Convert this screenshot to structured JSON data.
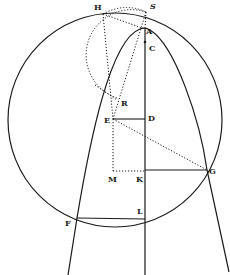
{
  "figure": {
    "type": "geometric-construction",
    "stroke_color": "#1a1a1a",
    "background": "#ffffff"
  },
  "points": {
    "H": {
      "label": "H",
      "x": 103,
      "y": 14
    },
    "S": {
      "label": "S",
      "x": 146,
      "y": 12
    },
    "A": {
      "label": "A",
      "x": 145,
      "y": 29
    },
    "C": {
      "label": "C",
      "x": 145,
      "y": 42
    },
    "R": {
      "label": "R",
      "x": 117,
      "y": 100
    },
    "E": {
      "label": "E",
      "x": 113,
      "y": 119
    },
    "D": {
      "label": "D",
      "x": 145,
      "y": 119
    },
    "M": {
      "label": "M",
      "x": 113,
      "y": 171
    },
    "K": {
      "label": "K",
      "x": 145,
      "y": 171
    },
    "G": {
      "label": "G",
      "x": 207,
      "y": 170
    },
    "F": {
      "label": "F",
      "x": 77,
      "y": 218
    },
    "L": {
      "label": "L",
      "x": 145,
      "y": 219
    }
  },
  "labels": {
    "H": "H",
    "S": "S",
    "A": "A",
    "C": "C",
    "R": "R",
    "E": "E",
    "D": "D",
    "M": "M",
    "K": "K",
    "G": "G",
    "F": "F",
    "L": "L"
  },
  "shapes": {
    "main_circle": {
      "cx": 115,
      "cy": 120,
      "r": 107,
      "style": "solid"
    },
    "dotted_circle": {
      "cx": 123,
      "cy": 56,
      "r": 43,
      "style": "dotted"
    },
    "parabola": {
      "vertex": "A",
      "style": "solid",
      "through": [
        "F",
        "G"
      ]
    },
    "axis": {
      "from": "A",
      "to_y": 275,
      "style": "solid"
    },
    "solid_segments": [
      [
        "E",
        "D"
      ],
      [
        "K",
        "G"
      ],
      [
        "F",
        "L"
      ]
    ],
    "dotted_segments": [
      [
        "H",
        "A"
      ],
      [
        "H",
        "M"
      ],
      [
        "S",
        "E"
      ],
      [
        "E",
        "G"
      ],
      [
        "E",
        "M"
      ],
      [
        "M",
        "K"
      ],
      [
        "H",
        "S"
      ]
    ]
  }
}
